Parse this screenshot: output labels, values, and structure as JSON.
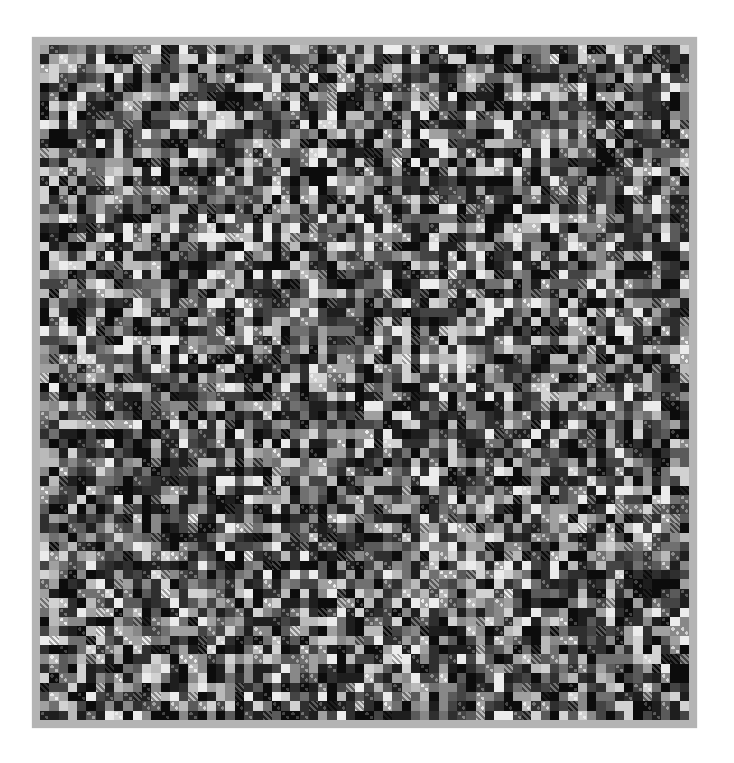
{
  "image": {
    "subject": "grayscale photograph of a patchwork quilt made of many small square fabric patches",
    "background_color": "#ffffff",
    "border_color": "#b4b4b4"
  },
  "quilt": {
    "columns": 70,
    "rows": 72,
    "seed": 1337,
    "gray_levels": [
      "#0c0c0c",
      "#1e1e1e",
      "#2f2f2f",
      "#444444",
      "#5a5a5a",
      "#707070",
      "#888888",
      "#a0a0a0",
      "#bababa",
      "#d2d2d2",
      "#ececec"
    ],
    "level_weights": [
      14,
      12,
      11,
      10,
      9,
      9,
      8,
      8,
      7,
      6,
      6
    ]
  }
}
